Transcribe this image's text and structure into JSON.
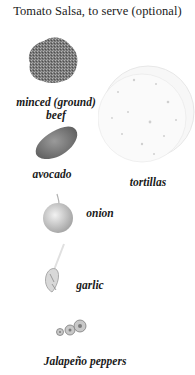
{
  "page": {
    "heading": "Tomato Salsa, to serve (optional)"
  },
  "ingredients": [
    {
      "id": "beef",
      "label_line1": "minced (ground)",
      "label_line2": "beef",
      "icon": "minced-beef-illustration"
    },
    {
      "id": "tortillas",
      "label": "tortillas",
      "icon": "tortillas-illustration"
    },
    {
      "id": "avocado",
      "label": "avocado",
      "icon": "avocado-illustration"
    },
    {
      "id": "onion",
      "label": "onion",
      "icon": "onion-illustration"
    },
    {
      "id": "garlic",
      "label": "garlic",
      "icon": "garlic-illustration"
    },
    {
      "id": "jalapeno",
      "label": "Jalapeño peppers",
      "icon": "jalapeno-illustration"
    }
  ]
}
